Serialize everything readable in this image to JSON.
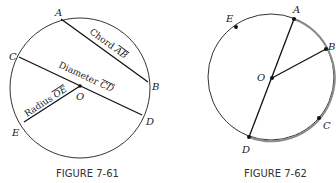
{
  "figures": [
    {
      "caption": "FIGURE 7-61",
      "circle": {
        "cx": 80,
        "cy": 88,
        "r": 70
      },
      "points": {
        "A": {
          "label": "A",
          "x": 61,
          "y": 19
        },
        "B": {
          "label": "B",
          "x": 148,
          "y": 82
        },
        "C": {
          "label": "C",
          "x": 19,
          "y": 57
        },
        "D": {
          "label": "D",
          "x": 142,
          "y": 115
        },
        "E": {
          "label": "E",
          "x": 24,
          "y": 122
        },
        "O": {
          "label": "O",
          "x": 80,
          "y": 86
        }
      },
      "segments": [
        {
          "from": "A",
          "to": "B",
          "label_prefix": "Chord ",
          "label_name": "AB"
        },
        {
          "from": "C",
          "to": "D",
          "label_prefix": "Diameter ",
          "label_name": "CD"
        },
        {
          "from": "O",
          "to": "E",
          "label_prefix": "Radius ",
          "label_name": "OE"
        }
      ]
    },
    {
      "caption": "FIGURE 7-62",
      "circle": {
        "cx": 271,
        "cy": 77,
        "r": 63
      },
      "highlight_color": "#8a8a8a",
      "points": {
        "A": {
          "label": "A",
          "x": 294,
          "y": 19
        },
        "B": {
          "label": "B",
          "x": 326,
          "y": 49
        },
        "C": {
          "label": "C",
          "x": 319,
          "y": 118
        },
        "D": {
          "label": "D",
          "x": 249,
          "y": 137
        },
        "E": {
          "label": "E",
          "x": 236,
          "y": 27
        },
        "O": {
          "label": "O",
          "x": 272,
          "y": 78
        }
      },
      "segments": [
        {
          "from": "A",
          "to": "D"
        },
        {
          "from": "O",
          "to": "B"
        }
      ]
    }
  ]
}
